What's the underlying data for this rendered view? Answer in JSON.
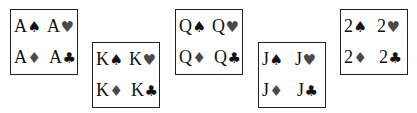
{
  "cards": [
    {
      "rank": "A",
      "entries": [
        {
          "rank": "A",
          "suit": "♠",
          "suit_name": "spade",
          "color": "black"
        },
        {
          "rank": "A",
          "suit": "♥",
          "suit_name": "heart",
          "color": "red"
        },
        {
          "rank": "A",
          "suit": "♦",
          "suit_name": "diamond",
          "color": "red"
        },
        {
          "rank": "A",
          "suit": "♣",
          "suit_name": "club",
          "color": "black"
        }
      ]
    },
    {
      "rank": "K",
      "entries": [
        {
          "rank": "K",
          "suit": "♠",
          "suit_name": "spade",
          "color": "black"
        },
        {
          "rank": "K",
          "suit": "♥",
          "suit_name": "heart",
          "color": "red"
        },
        {
          "rank": "K",
          "suit": "♦",
          "suit_name": "diamond",
          "color": "red"
        },
        {
          "rank": "K",
          "suit": "♣",
          "suit_name": "club",
          "color": "black"
        }
      ]
    },
    {
      "rank": "Q",
      "entries": [
        {
          "rank": "Q",
          "suit": "♠",
          "suit_name": "spade",
          "color": "black"
        },
        {
          "rank": "Q",
          "suit": "♥",
          "suit_name": "heart",
          "color": "red"
        },
        {
          "rank": "Q",
          "suit": "♦",
          "suit_name": "diamond",
          "color": "red"
        },
        {
          "rank": "Q",
          "suit": "♣",
          "suit_name": "club",
          "color": "black"
        }
      ]
    },
    {
      "rank": "J",
      "entries": [
        {
          "rank": "J",
          "suit": "♠",
          "suit_name": "spade",
          "color": "black"
        },
        {
          "rank": "J",
          "suit": "♥",
          "suit_name": "heart",
          "color": "red"
        },
        {
          "rank": "J",
          "suit": "♦",
          "suit_name": "diamond",
          "color": "red"
        },
        {
          "rank": "J",
          "suit": "♣",
          "suit_name": "club",
          "color": "black"
        }
      ]
    },
    {
      "rank": "2",
      "entries": [
        {
          "rank": "2",
          "suit": "♠",
          "suit_name": "spade",
          "color": "black"
        },
        {
          "rank": "2",
          "suit": "♥",
          "suit_name": "heart",
          "color": "red"
        },
        {
          "rank": "2",
          "suit": "♦",
          "suit_name": "diamond",
          "color": "red"
        },
        {
          "rank": "2",
          "suit": "♣",
          "suit_name": "club",
          "color": "black"
        }
      ]
    }
  ],
  "colors": {
    "black_suit": "#111111",
    "red_suit": "#4a4a4a",
    "border": "#222222"
  }
}
